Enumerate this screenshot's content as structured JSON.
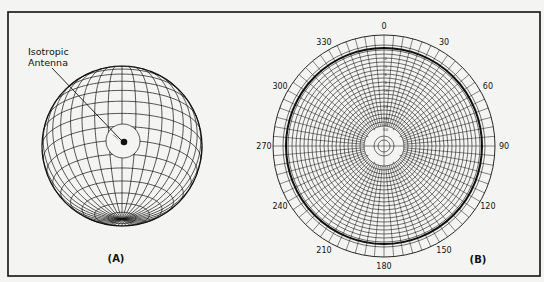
{
  "panels": {
    "a": {
      "label": "(A)",
      "callout_line1": "Isotropic",
      "callout_line2": "Antenna"
    },
    "b": {
      "label": "(B)",
      "angle_labels": [
        "0",
        "30",
        "60",
        "90",
        "120",
        "150",
        "180",
        "210",
        "240",
        "270",
        "300",
        "330"
      ]
    }
  },
  "chart_data": {
    "type": "polar",
    "title": "",
    "theta_ticks_deg": [
      0,
      30,
      60,
      90,
      120,
      150,
      180,
      210,
      240,
      270,
      300,
      330
    ],
    "radial_scale_db": [
      0,
      -2,
      -4,
      -6,
      -8,
      -10,
      -20,
      -30,
      -40,
      -50
    ],
    "series": [
      {
        "name": "isotropic pattern",
        "r_db": 0,
        "theta_range": [
          0,
          360
        ],
        "note": "constant circle"
      }
    ],
    "grid": true
  },
  "colors": {
    "background": "#f4f4f2",
    "lines": "#111111"
  }
}
